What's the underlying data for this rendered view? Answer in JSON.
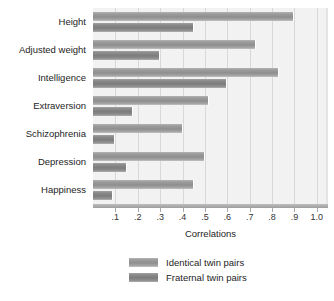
{
  "chart_data": {
    "type": "bar",
    "orientation": "horizontal",
    "title": "",
    "xlabel": "Correlations",
    "ylabel": "",
    "xlim": [
      0.0,
      1.05
    ],
    "xticks": [
      0.1,
      0.2,
      0.3,
      0.4,
      0.5,
      0.6,
      0.7,
      0.8,
      0.9,
      1.0
    ],
    "xticklabels": [
      ".1",
      ".2",
      ".3",
      ".4",
      ".5",
      ".6",
      ".7",
      ".8",
      ".9",
      "1.0"
    ],
    "grid": true,
    "grid_axis": "x",
    "legend_position": "bottom-center",
    "categories": [
      "Height",
      "Adjusted weight",
      "Intelligence",
      "Extraversion",
      "Schizophrenia",
      "Depression",
      "Happiness"
    ],
    "series": [
      {
        "name": "Identical twin pairs",
        "color": "#8e8e8e",
        "values": [
          0.9,
          0.73,
          0.83,
          0.52,
          0.4,
          0.5,
          0.45
        ]
      },
      {
        "name": "Fraternal twin pairs",
        "color": "#7c7c7c",
        "values": [
          0.45,
          0.3,
          0.6,
          0.18,
          0.1,
          0.15,
          0.09
        ]
      }
    ]
  },
  "legend": {
    "items": [
      {
        "label": "Identical twin pairs"
      },
      {
        "label": "Fraternal twin pairs"
      }
    ]
  },
  "axis": {
    "x_title": "Correlations"
  }
}
